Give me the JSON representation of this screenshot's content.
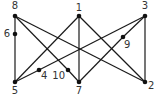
{
  "diagram": {
    "type": "graph",
    "nodes": [
      {
        "id": "1",
        "label": "1",
        "x": 79,
        "y": 16,
        "lx": 79,
        "ly": 11,
        "anchor": "middle"
      },
      {
        "id": "2",
        "label": "2",
        "x": 145,
        "y": 82,
        "lx": 148,
        "ly": 89,
        "anchor": "start"
      },
      {
        "id": "3",
        "label": "3",
        "x": 145,
        "y": 16,
        "lx": 145,
        "ly": 9,
        "anchor": "middle"
      },
      {
        "id": "4",
        "label": "4",
        "x": 39,
        "y": 70,
        "lx": 41,
        "ly": 79,
        "anchor": "start"
      },
      {
        "id": "5",
        "label": "5",
        "x": 15,
        "y": 82,
        "lx": 15,
        "ly": 94,
        "anchor": "middle"
      },
      {
        "id": "6",
        "label": "6",
        "x": 15,
        "y": 34,
        "lx": 10,
        "ly": 37,
        "anchor": "end"
      },
      {
        "id": "7",
        "label": "7",
        "x": 79,
        "y": 82,
        "lx": 79,
        "ly": 94,
        "anchor": "middle"
      },
      {
        "id": "8",
        "label": "8",
        "x": 15,
        "y": 16,
        "lx": 15,
        "ly": 9,
        "anchor": "middle"
      },
      {
        "id": "9",
        "label": "9",
        "x": 123,
        "y": 37,
        "lx": 124,
        "ly": 48,
        "anchor": "start"
      },
      {
        "id": "10",
        "label": "10",
        "x": 68,
        "y": 70,
        "lx": 65,
        "ly": 79,
        "anchor": "end"
      }
    ],
    "edges": [
      [
        "8",
        "6"
      ],
      [
        "6",
        "5"
      ],
      [
        "8",
        "10"
      ],
      [
        "10",
        "7"
      ],
      [
        "8",
        "2"
      ],
      [
        "1",
        "5"
      ],
      [
        "1",
        "7"
      ],
      [
        "1",
        "2"
      ],
      [
        "3",
        "4"
      ],
      [
        "4",
        "5"
      ],
      [
        "3",
        "9"
      ],
      [
        "9",
        "7"
      ],
      [
        "3",
        "2"
      ]
    ]
  },
  "caption": {
    "text": "...(cut off)"
  }
}
